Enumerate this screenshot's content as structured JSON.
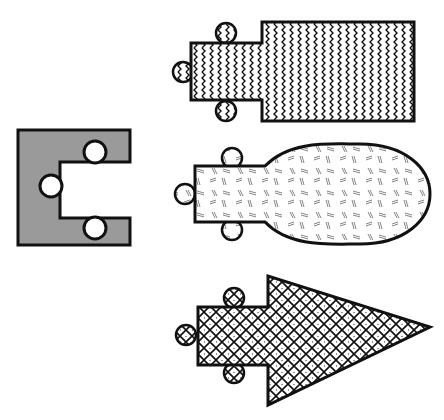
{
  "canvas": {
    "width": 444,
    "height": 420,
    "background": "#ffffff"
  },
  "colors": {
    "stroke": "#111111",
    "gray_fill": "#9a9a9a",
    "white": "#ffffff"
  },
  "figures": [
    {
      "id": "c-shape",
      "fill": "solid-gray",
      "description": "C-shaped gray block with three white circular notches"
    },
    {
      "id": "zigzag-shape",
      "fill": "zigzag-pattern",
      "description": "Small rectangle with three knobs joined to large rectangle"
    },
    {
      "id": "dash-shape",
      "fill": "dash-pattern",
      "description": "Small rectangle with three knobs joined to ellipse"
    },
    {
      "id": "arrow-shape",
      "fill": "crosshatch-dot-pattern",
      "description": "Small rectangle with three knobs joined to triangle arrowhead"
    }
  ]
}
